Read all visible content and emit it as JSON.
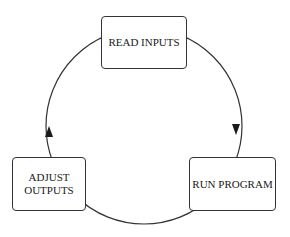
{
  "diagram": {
    "type": "cycle",
    "direction": "clockwise",
    "nodes": [
      {
        "id": "read",
        "label": "READ INPUTS"
      },
      {
        "id": "run",
        "label": "RUN PROGRAM"
      },
      {
        "id": "adjust",
        "label": "ADJUST\nOUTPUTS"
      }
    ],
    "edges": [
      {
        "from": "read",
        "to": "run"
      },
      {
        "from": "run",
        "to": "adjust"
      },
      {
        "from": "adjust",
        "to": "read"
      }
    ],
    "colors": {
      "line": "#333333",
      "background": "#ffffff",
      "text": "#1a1a1a"
    }
  }
}
